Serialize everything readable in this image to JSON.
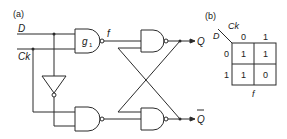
{
  "figure": {
    "part_a": {
      "label": "(a)",
      "inputs": {
        "d": "D",
        "ck": "Ck"
      },
      "gate_label": "g",
      "gate_subscript": "1",
      "node_label": "f",
      "outputs": {
        "q": "Q",
        "q_bar": "Q"
      }
    },
    "part_b": {
      "label": "(b)",
      "row_var": "D",
      "col_var": "Ck",
      "col_headers": [
        "0",
        "1"
      ],
      "row_headers": [
        "0",
        "1"
      ],
      "cells": [
        [
          "1",
          "1"
        ],
        [
          "1",
          "0"
        ]
      ],
      "caption": "f"
    }
  },
  "colors": {
    "ink": "#2a2a2a",
    "background": "#ffffff"
  }
}
